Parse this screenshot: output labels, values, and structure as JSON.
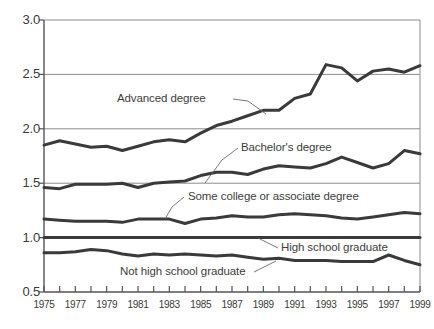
{
  "figure": {
    "cropped_title_fragment": "",
    "background_color": "#ffffff",
    "line_color": "#3a3a3a",
    "grid_color": "#8c8c8c",
    "axis_color": "#555555"
  },
  "axes": {
    "y_ticks": [
      "3.0",
      "2.5",
      "2.0",
      "1.5",
      "1.0",
      "0.5"
    ],
    "y_tick_values": [
      3.0,
      2.5,
      2.0,
      1.5,
      1.0,
      0.5
    ],
    "x_ticks": [
      "1975",
      "1977",
      "1979",
      "1981",
      "1983",
      "1985",
      "1987",
      "1989",
      "1991",
      "1993",
      "1995",
      "1997",
      "1999"
    ],
    "x_tick_values": [
      1975,
      1977,
      1979,
      1981,
      1983,
      1985,
      1987,
      1989,
      1991,
      1993,
      1995,
      1997,
      1999
    ]
  },
  "series_labels": {
    "advanced": "Advanced degree",
    "bachelors": "Bachelor's degree",
    "some_college": "Some college or associate degree",
    "high_school": "High school graduate",
    "not_high_school": "Not high school graduate"
  },
  "chart_data": {
    "type": "line",
    "title": "",
    "xlabel": "",
    "ylabel": "",
    "xlim": [
      1975,
      1999
    ],
    "ylim": [
      0.5,
      3.0
    ],
    "grid": true,
    "grid_lines_y": [
      1.0,
      1.5,
      2.0,
      2.5
    ],
    "legend": "inline-annotations",
    "x": [
      1975,
      1976,
      1977,
      1978,
      1979,
      1980,
      1981,
      1982,
      1983,
      1984,
      1985,
      1986,
      1987,
      1988,
      1989,
      1990,
      1991,
      1992,
      1993,
      1994,
      1995,
      1996,
      1997,
      1998,
      1999
    ],
    "series": [
      {
        "name": "Advanced degree",
        "values": [
          1.85,
          1.89,
          1.86,
          1.83,
          1.84,
          1.8,
          1.84,
          1.88,
          1.9,
          1.88,
          1.96,
          2.03,
          2.07,
          2.12,
          2.17,
          2.17,
          2.28,
          2.32,
          2.59,
          2.56,
          2.44,
          2.53,
          2.55,
          2.52,
          2.58
        ]
      },
      {
        "name": "Bachelor's degree",
        "values": [
          1.46,
          1.45,
          1.49,
          1.49,
          1.49,
          1.5,
          1.46,
          1.5,
          1.51,
          1.52,
          1.57,
          1.6,
          1.6,
          1.58,
          1.63,
          1.66,
          1.65,
          1.64,
          1.68,
          1.74,
          1.69,
          1.64,
          1.68,
          1.8,
          1.77
        ]
      },
      {
        "name": "Some college or associate degree",
        "values": [
          1.17,
          1.16,
          1.15,
          1.15,
          1.15,
          1.14,
          1.17,
          1.17,
          1.17,
          1.13,
          1.17,
          1.18,
          1.2,
          1.19,
          1.19,
          1.21,
          1.22,
          1.21,
          1.2,
          1.18,
          1.17,
          1.19,
          1.21,
          1.23,
          1.22
        ]
      },
      {
        "name": "High school graduate",
        "values": [
          1.0,
          1.0,
          1.0,
          1.0,
          1.0,
          1.0,
          1.0,
          1.0,
          1.0,
          1.0,
          1.0,
          1.0,
          1.0,
          1.0,
          1.0,
          1.0,
          1.0,
          1.0,
          1.0,
          1.0,
          1.0,
          1.0,
          1.0,
          1.0,
          1.0
        ]
      },
      {
        "name": "Not high school graduate",
        "values": [
          0.86,
          0.86,
          0.87,
          0.89,
          0.88,
          0.85,
          0.83,
          0.85,
          0.84,
          0.85,
          0.84,
          0.83,
          0.84,
          0.82,
          0.8,
          0.81,
          0.79,
          0.79,
          0.79,
          0.78,
          0.78,
          0.78,
          0.84,
          0.79,
          0.75
        ]
      }
    ]
  }
}
